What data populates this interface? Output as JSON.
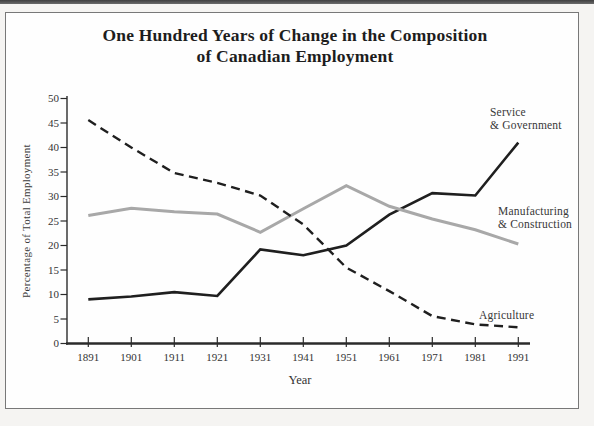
{
  "figure": {
    "title_line1": "One Hundred Years of Change in the Composition",
    "title_line2": "of Canadian Employment"
  },
  "chart_data": {
    "type": "line",
    "title": "One Hundred Years of Change in the Composition of Canadian Employment",
    "xlabel": "Year",
    "ylabel": "Percentage of Total Employment",
    "x": [
      1891,
      1901,
      1911,
      1921,
      1931,
      1941,
      1951,
      1961,
      1971,
      1981,
      1991
    ],
    "xlim": [
      1891,
      1991
    ],
    "ylim": [
      0,
      50
    ],
    "yticks": [
      0,
      5,
      10,
      15,
      20,
      25,
      30,
      35,
      40,
      45,
      50
    ],
    "grid": false,
    "legend_position": "inline-annotations",
    "series": [
      {
        "name": "Service & Government",
        "label_lines": [
          "Service",
          "& Government"
        ],
        "style": "solid",
        "color": "#1f1f1f",
        "values": [
          9.0,
          9.6,
          10.5,
          9.7,
          19.2,
          18.0,
          20.0,
          26.3,
          30.7,
          30.2,
          41.0
        ]
      },
      {
        "name": "Manufacturing & Construction",
        "label_lines": [
          "Manufacturing",
          "& Construction"
        ],
        "style": "solid",
        "color": "#a8a8a8",
        "values": [
          26.1,
          27.6,
          26.9,
          26.4,
          22.7,
          27.5,
          32.2,
          28.0,
          25.4,
          23.2,
          20.3
        ]
      },
      {
        "name": "Agriculture",
        "label_lines": [
          "Agriculture"
        ],
        "style": "dashed",
        "color": "#1f1f1f",
        "values": [
          45.6,
          40.0,
          34.8,
          32.8,
          30.2,
          24.3,
          15.5,
          10.7,
          5.6,
          3.9,
          3.3
        ]
      }
    ],
    "axis_color": "#2b2b2b"
  }
}
